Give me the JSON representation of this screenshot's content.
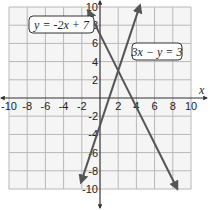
{
  "chart_data": {
    "type": "line",
    "title": "",
    "xlabel": "x",
    "ylabel": "y",
    "xlim": [
      -10,
      10
    ],
    "ylim": [
      -10,
      10
    ],
    "grid": true,
    "x_ticks": [
      "-10",
      "-8",
      "-6",
      "-4",
      "-2",
      "2",
      "4",
      "6",
      "8",
      "10"
    ],
    "y_ticks": [
      "10",
      "8",
      "6",
      "4",
      "2",
      "-2",
      "-4",
      "-6",
      "-8",
      "-10"
    ],
    "series": [
      {
        "name": "y = -2x + 7",
        "equation": "y = -2x + 7",
        "slope": -2,
        "intercept": 7,
        "x_range": [
          -1.3,
          8.5
        ],
        "color": "#555555"
      },
      {
        "name": "3x - y = 3",
        "equation": "3x - y = 3",
        "slope": 3,
        "intercept": -3,
        "x_range": [
          -2.1,
          4.4
        ],
        "color": "#555555"
      }
    ],
    "annotations": [
      {
        "text": "y = -2x + 7",
        "attached_to": "y = -2x + 7"
      },
      {
        "text": "3x − y = 3",
        "attached_to": "3x - y = 3"
      }
    ],
    "intersection": [
      2,
      3
    ]
  },
  "labels": {
    "x_axis": "x",
    "line1": "y = -2x + 7",
    "line2": "3x − y = 3"
  },
  "colors": {
    "grid": "#b8b8b8",
    "grid_bg": "#f4f4f4",
    "axis": "#333333",
    "line": "#555555"
  }
}
